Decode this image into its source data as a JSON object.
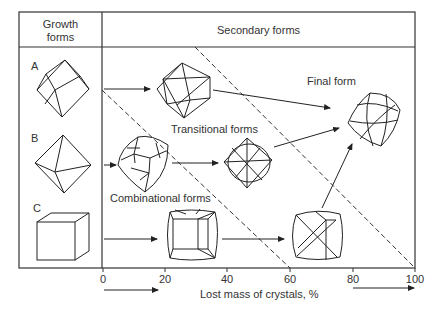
{
  "header": {
    "growth_forms": [
      "Growth",
      "forms"
    ],
    "secondary_forms": "Secondary forms"
  },
  "rows": [
    {
      "letter": "A",
      "shape": "rhombic-dodecahedron"
    },
    {
      "letter": "B",
      "shape": "octahedron"
    },
    {
      "letter": "C",
      "shape": "cube"
    }
  ],
  "zones": {
    "transitional": "Transitional forms",
    "combinational": "Combinational forms",
    "final": "Final form"
  },
  "axis": {
    "label": "Lost mass of crystals, %",
    "ticks": [
      "0",
      "20",
      "40",
      "60",
      "80",
      "100"
    ]
  },
  "colors": {
    "line": "#222222",
    "frame": "#333333",
    "text": "#333333"
  }
}
